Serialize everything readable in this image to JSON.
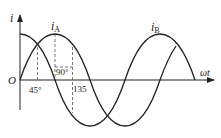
{
  "diagram": {
    "title": "",
    "axes": {
      "y_label": "i",
      "x_label": "ωt",
      "origin_label": "O"
    },
    "curves": [
      {
        "name": "i_A",
        "label_main": "i",
        "label_sub": "A",
        "type": "sin",
        "phase_deg": 0
      },
      {
        "name": "i_B",
        "label_main": "i",
        "label_sub": "B",
        "type": "cos",
        "phase_deg": 90
      }
    ],
    "markers": [
      {
        "label": "45°",
        "angle_deg": 45
      },
      {
        "label": "90°",
        "angle_deg": 90
      },
      {
        "label": "135",
        "angle_deg": 135
      }
    ],
    "colors": {
      "line": "#222222",
      "dash": "#555555"
    }
  }
}
